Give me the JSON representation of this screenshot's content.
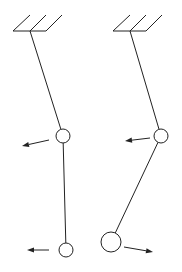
{
  "diagram": {
    "type": "double-pendulum-normal-modes",
    "stroke_color": "#222222",
    "background": "#ffffff",
    "pendulums": [
      {
        "name": "in-phase-mode",
        "ceiling": {
          "x1": 13,
          "x2": 46,
          "y": 31,
          "hatches": [
            [
              13,
              31,
              30,
              15
            ],
            [
              30,
              31,
              46,
              15
            ],
            [
              46,
              31,
              62,
              15
            ]
          ]
        },
        "pivot": {
          "x": 30,
          "y": 31
        },
        "masses": [
          {
            "x": 63,
            "y": 136,
            "r": 7,
            "arrow": {
              "x1": 49,
              "y1": 140,
              "x2": 22,
              "y2": 146,
              "direction": "left"
            }
          },
          {
            "x": 66,
            "y": 250,
            "r": 7,
            "arrow": {
              "x1": 49,
              "y1": 250,
              "x2": 27,
              "y2": 250,
              "direction": "left"
            }
          }
        ]
      },
      {
        "name": "anti-phase-mode",
        "ceiling": {
          "x1": 113,
          "x2": 146,
          "y": 31,
          "hatches": [
            [
              113,
              31,
              130,
              15
            ],
            [
              130,
              31,
              146,
              15
            ],
            [
              146,
              31,
              162,
              15
            ]
          ]
        },
        "pivot": {
          "x": 130,
          "y": 31
        },
        "masses": [
          {
            "x": 161,
            "y": 136,
            "r": 7,
            "arrow": {
              "x1": 150,
              "y1": 138,
              "x2": 125,
              "y2": 141,
              "direction": "left"
            }
          },
          {
            "x": 111,
            "y": 242,
            "r": 10,
            "arrow": {
              "x1": 124,
              "y1": 247,
              "x2": 153,
              "y2": 252,
              "direction": "right"
            }
          }
        ]
      }
    ]
  }
}
